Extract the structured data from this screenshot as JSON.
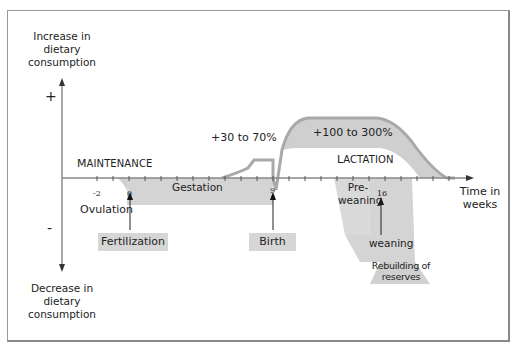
{
  "y_axis": {
    "top_label": "Increase in\ndietary\nconsumption",
    "bottom_label": "Decrease in\ndietary\nconsumption",
    "plus": "+",
    "minus": "-"
  },
  "x_axis": {
    "label": "Time in\nweeks",
    "ticks": [
      "-2",
      "0",
      "9",
      "16"
    ]
  },
  "phases": {
    "maintenance_first": "M",
    "maintenance_rest": "AINTENANCE",
    "lactation_first": "L",
    "lactation_rest": "ACTATION",
    "gestation": "Gestation",
    "pre_weaning": "Pre-\nweaning",
    "weaning": "weaning",
    "rebuilding": "Rebuilding of\nreserves"
  },
  "annotations": {
    "gestation_increase": "+30 to 70%",
    "lactation_increase": "+100 to 300%"
  },
  "events": {
    "ovulation": "Ovulation",
    "fertilization": "Fertilization",
    "birth": "Birth"
  },
  "colors": {
    "fill": "#d4d4d4",
    "curve": "#a9a9a9",
    "axis": "#666666",
    "text": "#222222"
  }
}
